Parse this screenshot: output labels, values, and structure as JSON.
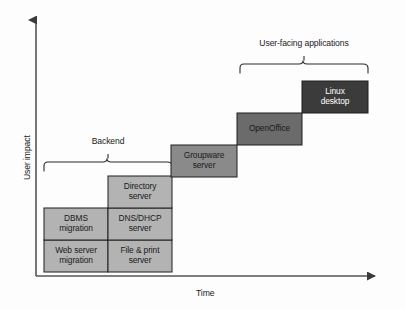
{
  "diagram": {
    "axes": {
      "y_label": "User impact",
      "x_label": "Time",
      "axis_color": "#555555"
    },
    "colors": {
      "background": "#fdfdfd",
      "light_gray": "#b3b3b3",
      "mid_gray": "#8a8a8a",
      "dark_gray": "#6b6b6b",
      "darkest_gray": "#3b3b3b",
      "stroke": "#1f1f1f",
      "text_dark": "#1a1a1a",
      "text_light": "#ffffff"
    },
    "braces": [
      {
        "id": "backend-brace",
        "label": "Backend",
        "x1": 44,
        "x2": 172,
        "tip_y": 158,
        "arm_y": 171,
        "label_x": 108,
        "label_y": 140
      },
      {
        "id": "user-facing-brace",
        "label": "User-facing applications",
        "x1": 240,
        "x2": 368,
        "tip_y": 60,
        "arm_y": 73,
        "label_x": 304,
        "label_y": 42
      }
    ],
    "boxes": [
      {
        "id": "web-server-migration",
        "label": "Web server migration",
        "line1": "Web server",
        "line2": "migration",
        "x": 44,
        "y": 240,
        "w": 64,
        "h": 32,
        "fill": "#b3b3b3",
        "text": "dark"
      },
      {
        "id": "dbms-migration",
        "label": "DBMS migration",
        "line1": "DBMS",
        "line2": "migration",
        "x": 44,
        "y": 208,
        "w": 64,
        "h": 32,
        "fill": "#b3b3b3",
        "text": "dark"
      },
      {
        "id": "file-and-print-server",
        "label": "File & print server",
        "line1": "File & print",
        "line2": "server",
        "x": 108,
        "y": 240,
        "w": 64,
        "h": 32,
        "fill": "#b3b3b3",
        "text": "dark"
      },
      {
        "id": "dns-dhcp-server",
        "label": "DNS/DHCP server",
        "line1": "DNS/DHCP",
        "line2": "server",
        "x": 108,
        "y": 208,
        "w": 64,
        "h": 32,
        "fill": "#b3b3b3",
        "text": "dark"
      },
      {
        "id": "directory-server",
        "label": "Directory server",
        "line1": "Directory",
        "line2": "server",
        "x": 108,
        "y": 176,
        "w": 64,
        "h": 32,
        "fill": "#b3b3b3",
        "text": "dark"
      },
      {
        "id": "groupware-server",
        "label": "Groupware server",
        "line1": "Groupware",
        "line2": "server",
        "x": 171,
        "y": 145,
        "w": 66,
        "h": 32,
        "fill": "#8a8a8a",
        "text": "dark"
      },
      {
        "id": "openoffice",
        "label": "OpenOffice",
        "line1": "OpenOffice",
        "line2": "",
        "x": 237,
        "y": 113,
        "w": 65,
        "h": 32,
        "fill": "#6b6b6b",
        "text": "dark"
      },
      {
        "id": "linux-desktop",
        "label": "Linux desktop",
        "line1": "Linux",
        "line2": "desktop",
        "x": 302,
        "y": 81,
        "w": 66,
        "h": 32,
        "fill": "#3b3b3b",
        "text": "light"
      }
    ]
  }
}
